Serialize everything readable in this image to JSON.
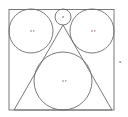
{
  "figure": {
    "background_color": "#ffffff",
    "stroke_color": "#6b6b6b",
    "label_color": "#3a3a3a",
    "square": {
      "name": "outer-square",
      "x": 9,
      "y": 9.5,
      "width": 105,
      "height": 100.5,
      "side_label": "a",
      "side_label_x": 120,
      "side_label_y": 62
    },
    "circles": [
      {
        "name": "left-circle",
        "cx": 31,
        "cy": 31,
        "r": 22,
        "center_marked": true,
        "center_label": "r"
      },
      {
        "name": "right-circle",
        "cx": 92,
        "cy": 31,
        "r": 22,
        "center_marked": true,
        "center_label": "r"
      },
      {
        "name": "top-small-circle",
        "cx": 63,
        "cy": 17,
        "r": 8,
        "center_marked": true,
        "center_label": ""
      },
      {
        "name": "bottom-large-circle",
        "cx": 63,
        "cy": 81,
        "r": 29,
        "center_marked": true,
        "center_label": "r"
      }
    ],
    "triangle": {
      "name": "inscribed-triangle",
      "apex_x": 63,
      "apex_y": 25,
      "base_left_x": 14,
      "base_left_y": 110,
      "base_right_x": 112,
      "base_right_y": 110
    }
  }
}
